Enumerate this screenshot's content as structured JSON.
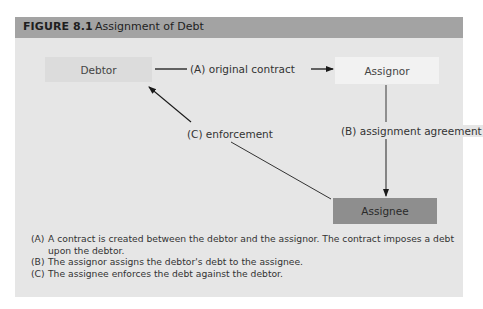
{
  "figure": {
    "number": "FIGURE 8.1",
    "title": "Assignment of Debt",
    "colors": {
      "header": "#a3a3a3",
      "panel": "#e6e6e6",
      "debtor_box": "#dcdcdc",
      "assignor_box": "#f2f2f2",
      "assignee_box": "#8e8e8e"
    }
  },
  "nodes": {
    "debtor": "Debtor",
    "assignor": "Assignor",
    "assignee": "Assignee"
  },
  "edges": {
    "a": "(A) original contract",
    "b": "(B) assignment agreement",
    "c": "(C) enforcement"
  },
  "notes": [
    {
      "tag": "(A)",
      "text": "A contract is created between the debtor and the assignor. The contract imposes a debt upon the debtor."
    },
    {
      "tag": "(B)",
      "text": "The assignor assigns the debtor's debt to the assignee."
    },
    {
      "tag": "(C)",
      "text": "The assignee enforces the debt against the debtor."
    }
  ]
}
